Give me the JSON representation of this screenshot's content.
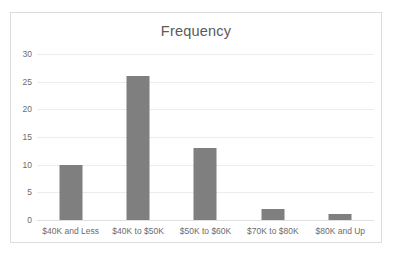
{
  "chart_data": {
    "type": "bar",
    "title": "Frequency",
    "xlabel": "",
    "ylabel": "",
    "categories": [
      "$40K and Less",
      "$40K to $50K",
      "$50K to $60K",
      "$70K to $80K",
      "$80K and Up"
    ],
    "values": [
      10,
      26,
      13,
      2,
      1
    ],
    "ylim": [
      0,
      30
    ],
    "ytick_values": [
      0,
      5,
      10,
      15,
      20,
      25,
      30
    ],
    "ytick_labels": [
      "0",
      "5",
      "10",
      "15",
      "20",
      "25",
      "30"
    ],
    "grid": true,
    "grid_axis": "y",
    "legend": false,
    "legend_position": "none",
    "bar_color": "#7f7f7f",
    "gridline_color": "#ececec",
    "text_color": "#6b6b6b",
    "title_color": "#5a5a5a",
    "border_color": "#dcdcdc",
    "background_color": "#ffffff"
  }
}
